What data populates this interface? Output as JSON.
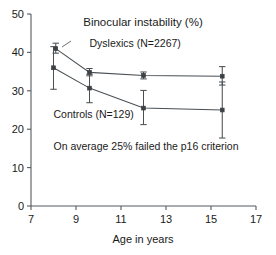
{
  "chart_data": {
    "type": "line",
    "title": "Binocular instability (%)",
    "xlabel": "Age in years",
    "ylabel": "",
    "xlim": [
      7,
      17
    ],
    "ylim": [
      0,
      50
    ],
    "xticks": [
      7,
      9,
      11,
      13,
      15,
      17
    ],
    "yticks": [
      0,
      10,
      20,
      30,
      40,
      50
    ],
    "grid": false,
    "legend_position": "inline-annotations",
    "annotations": [
      {
        "text": "On average 25% failed the p16 criterion",
        "x": 8.0,
        "y": 14.5
      }
    ],
    "series": [
      {
        "name": "Dyslexics (N=2267)",
        "label_x": 9.6,
        "label_y": 41.5,
        "x": [
          8.1,
          9.6,
          12.0,
          15.5
        ],
        "values": [
          41.0,
          34.8,
          34.0,
          33.8
        ],
        "err_low": [
          39.8,
          33.9,
          33.1,
          31.5
        ],
        "err_high": [
          42.4,
          35.8,
          34.9,
          36.3
        ]
      },
      {
        "name": "Controls (N=129)",
        "label_x": 8.0,
        "label_y": 23.0,
        "x": [
          8.0,
          9.6,
          12.0,
          15.5
        ],
        "values": [
          36.0,
          30.7,
          25.5,
          25.0
        ],
        "err_low": [
          30.4,
          26.9,
          21.2,
          17.7
        ],
        "err_high": [
          41.5,
          34.3,
          30.1,
          32.3
        ]
      }
    ]
  },
  "axis": {
    "x_tick_labels": [
      "7",
      "9",
      "11",
      "13",
      "15",
      "17"
    ],
    "y_tick_labels": [
      "0",
      "10",
      "20",
      "30",
      "40",
      "50"
    ],
    "x_title": "Age in years"
  },
  "labels": {
    "title": "Binocular instability (%)",
    "series_dyslexics": "Dyslexics (N=2267)",
    "series_controls": "Controls (N=129)",
    "footnote": "On average 25% failed the p16 criterion"
  }
}
